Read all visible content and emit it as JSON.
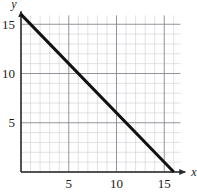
{
  "chart_data": {
    "type": "line",
    "title": "",
    "xlabel": "x",
    "ylabel": "y",
    "xlim": [
      0,
      17.2
    ],
    "ylim": [
      0,
      16.3
    ],
    "grid": true,
    "grid_minor_step": 1,
    "grid_major_step": 5,
    "legend": "none",
    "x_ticks": [
      5,
      10,
      15
    ],
    "y_ticks": [
      5,
      10,
      15
    ],
    "x_tick_labels": [
      "5",
      "10",
      "15"
    ],
    "y_tick_labels": [
      "5",
      "10",
      "15"
    ],
    "series": [
      {
        "name": "line",
        "color": "#111111",
        "width": 3,
        "x": [
          0,
          16
        ],
        "y": [
          16,
          0
        ],
        "slope": -1,
        "intercept": 16,
        "equation": "y = -x + 16"
      }
    ],
    "annotations": []
  },
  "axes": {
    "x_axis_label": "x",
    "y_axis_label": "y",
    "x_axis_arrow": "arrow-right",
    "y_axis_arrow": "arrow-up"
  },
  "colors": {
    "line": "#111111",
    "axis": "#2a2a2a",
    "grid_minor": "#d6d2d9",
    "grid_major": "#8a8690",
    "background": "#ffffff",
    "text": "#1a1a1a"
  }
}
